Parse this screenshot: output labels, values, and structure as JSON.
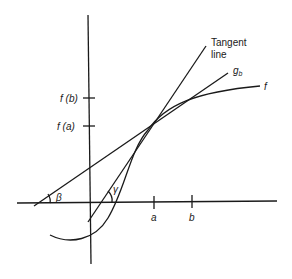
{
  "labels": {
    "tangent_line_1": "Tangent",
    "tangent_line_2": "line",
    "secant": "g",
    "secant_sub": "b",
    "function": "f",
    "fb": "f (b)",
    "fa": "f (a)",
    "a": "a",
    "b": "b",
    "beta": "β",
    "gamma": "γ"
  },
  "colors": {
    "ink": "#1a1a1a",
    "background": "#ffffff"
  }
}
